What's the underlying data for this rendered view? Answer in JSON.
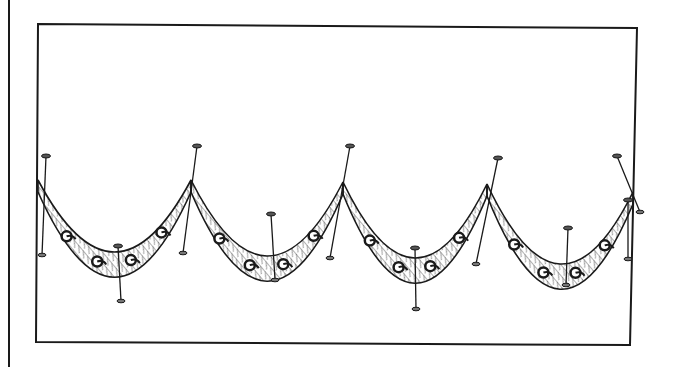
{
  "figure": {
    "caption": "",
    "colors": {
      "ink": "#1a1a1a",
      "paper": "#ffffff",
      "shade": "#bdbdbd"
    },
    "margin_line": {
      "x": 9,
      "y1": 0,
      "y2": 367
    },
    "frame": {
      "points": [
        [
          38,
          24
        ],
        [
          637,
          28
        ],
        [
          630,
          345
        ],
        [
          36,
          342
        ]
      ]
    },
    "swags": [
      {
        "from": [
          38,
          180
        ],
        "to": [
          191,
          180
        ],
        "sag": 262
      },
      {
        "from": [
          191,
          180
        ],
        "to": [
          343,
          182
        ],
        "sag": 266
      },
      {
        "from": [
          343,
          182
        ],
        "to": [
          487,
          184
        ],
        "sag": 268
      },
      {
        "from": [
          487,
          184
        ],
        "to": [
          633,
          192
        ],
        "sag": 274
      }
    ],
    "swag_band_width": 24,
    "motifs_count": 16,
    "pins": [
      {
        "head": [
          46,
          156
        ],
        "tail": [
          42,
          255
        ]
      },
      {
        "head": [
          197,
          146
        ],
        "tail": [
          183,
          253
        ]
      },
      {
        "head": [
          350,
          146
        ],
        "tail": [
          330,
          258
        ]
      },
      {
        "head": [
          498,
          158
        ],
        "tail": [
          476,
          264
        ]
      },
      {
        "head": [
          617,
          156
        ],
        "tail": [
          640,
          212
        ]
      },
      {
        "head": [
          118,
          246
        ],
        "tail": [
          121,
          301
        ]
      },
      {
        "head": [
          271,
          214
        ],
        "tail": [
          275,
          280
        ]
      },
      {
        "head": [
          415,
          248
        ],
        "tail": [
          416,
          309
        ]
      },
      {
        "head": [
          568,
          228
        ],
        "tail": [
          566,
          285
        ]
      },
      {
        "head": [
          628,
          200
        ],
        "tail": [
          628,
          259
        ]
      }
    ]
  }
}
